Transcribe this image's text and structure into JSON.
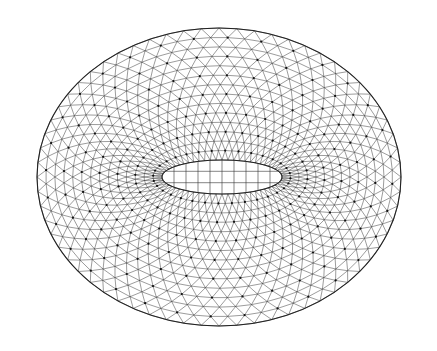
{
  "diagram": {
    "type": "triangular-mesh",
    "colors": {
      "background": "#ffffff",
      "line": "#2a2a2a",
      "node": "#111111"
    },
    "outer_ellipse": {
      "cx": 219,
      "cy": 177,
      "rx": 182,
      "ry": 149
    },
    "inner_ellipse": {
      "cx": 222,
      "cy": 177,
      "rx": 60,
      "ry": 17
    },
    "rings": 14,
    "segments": 64,
    "inner_grid": {
      "vertical_lines": 9,
      "horizontal_lines": 2
    }
  }
}
